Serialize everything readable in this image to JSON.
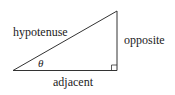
{
  "diagram": {
    "type": "right-triangle",
    "labels": {
      "hypotenuse": "hypotenuse",
      "opposite": "opposite",
      "adjacent": "adjacent",
      "angle": "θ"
    },
    "colors": {
      "line": "#333333",
      "text": "#222222",
      "background": "#ffffff"
    }
  }
}
